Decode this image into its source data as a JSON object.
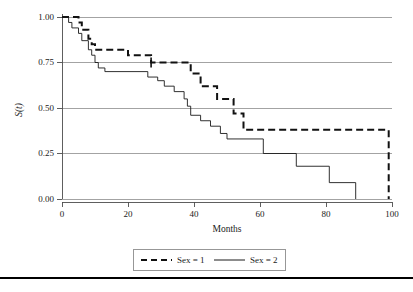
{
  "chart_data": {
    "type": "line",
    "title": "",
    "subtitle": "",
    "xlabel": "Months",
    "ylabel": "S(t)",
    "xlim": [
      0,
      100
    ],
    "ylim": [
      0.0,
      1.0
    ],
    "xticks": [
      "0",
      "20",
      "40",
      "60",
      "80",
      "100"
    ],
    "xtick_values": [
      0,
      20,
      40,
      60,
      80,
      100
    ],
    "yticks": [
      "0.00",
      "0.25",
      "0.50",
      "0.75",
      "1.00"
    ],
    "ytick_values": [
      0.0,
      0.25,
      0.5,
      0.75,
      1.0
    ],
    "grid": "horizontal",
    "legend_position": "below-axes",
    "series": [
      {
        "name": "Sex = 1",
        "style": "dashed",
        "color": "#111111",
        "steps": [
          [
            0,
            1.0
          ],
          [
            5,
            1.0
          ],
          [
            5,
            0.97
          ],
          [
            6,
            0.97
          ],
          [
            6,
            0.93
          ],
          [
            8,
            0.93
          ],
          [
            8,
            0.88
          ],
          [
            9,
            0.88
          ],
          [
            9,
            0.85
          ],
          [
            10,
            0.85
          ],
          [
            10,
            0.82
          ],
          [
            20,
            0.82
          ],
          [
            20,
            0.79
          ],
          [
            27,
            0.79
          ],
          [
            27,
            0.75
          ],
          [
            39,
            0.75
          ],
          [
            39,
            0.69
          ],
          [
            42,
            0.69
          ],
          [
            42,
            0.62
          ],
          [
            47,
            0.62
          ],
          [
            47,
            0.55
          ],
          [
            52,
            0.55
          ],
          [
            52,
            0.47
          ],
          [
            55,
            0.47
          ],
          [
            55,
            0.38
          ],
          [
            99,
            0.38
          ],
          [
            99,
            0.0
          ]
        ],
        "censor_points": [
          [
            27,
            0.75
          ]
        ]
      },
      {
        "name": "Sex = 2",
        "style": "solid",
        "color": "#1a1a1a",
        "steps": [
          [
            0,
            1.0
          ],
          [
            2,
            1.0
          ],
          [
            2,
            0.97
          ],
          [
            3,
            0.97
          ],
          [
            3,
            0.94
          ],
          [
            5,
            0.94
          ],
          [
            5,
            0.91
          ],
          [
            6,
            0.91
          ],
          [
            6,
            0.87
          ],
          [
            8,
            0.87
          ],
          [
            8,
            0.82
          ],
          [
            9,
            0.82
          ],
          [
            9,
            0.79
          ],
          [
            10,
            0.79
          ],
          [
            10,
            0.75
          ],
          [
            11,
            0.75
          ],
          [
            11,
            0.72
          ],
          [
            13,
            0.72
          ],
          [
            13,
            0.7
          ],
          [
            26,
            0.7
          ],
          [
            26,
            0.67
          ],
          [
            29,
            0.67
          ],
          [
            29,
            0.65
          ],
          [
            31,
            0.65
          ],
          [
            31,
            0.62
          ],
          [
            34,
            0.62
          ],
          [
            34,
            0.59
          ],
          [
            37,
            0.59
          ],
          [
            37,
            0.55
          ],
          [
            38,
            0.55
          ],
          [
            38,
            0.51
          ],
          [
            39,
            0.51
          ],
          [
            39,
            0.46
          ],
          [
            42,
            0.46
          ],
          [
            42,
            0.43
          ],
          [
            45,
            0.43
          ],
          [
            45,
            0.4
          ],
          [
            48,
            0.4
          ],
          [
            48,
            0.36
          ],
          [
            50,
            0.36
          ],
          [
            50,
            0.33
          ],
          [
            61,
            0.33
          ],
          [
            61,
            0.25
          ],
          [
            71,
            0.25
          ],
          [
            71,
            0.18
          ],
          [
            81,
            0.18
          ],
          [
            81,
            0.09
          ],
          [
            89,
            0.09
          ],
          [
            89,
            0.0
          ]
        ],
        "censor_points": []
      }
    ]
  },
  "legend": {
    "items": [
      {
        "label": "Sex = 1",
        "style": "dashed"
      },
      {
        "label": "Sex = 2",
        "style": "solid"
      }
    ]
  },
  "axes": {
    "x_title": "Months",
    "y_title_base": "S",
    "y_title_var": "(t)"
  }
}
